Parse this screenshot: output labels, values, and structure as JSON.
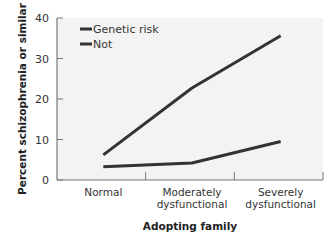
{
  "chart_data": {
    "type": "line",
    "title": "",
    "xlabel": "Adopting family",
    "ylabel": "Percent schizophrenia or similar",
    "categories": [
      "Normal",
      "Moderately dysfunctional",
      "Severely dysfunctional"
    ],
    "category_lines": [
      [
        "Normal"
      ],
      [
        "Moderately",
        "dysfunctional"
      ],
      [
        "Severely",
        "dysfunctional"
      ]
    ],
    "series": [
      {
        "name": "Genetic risk",
        "values": [
          6.2,
          22.7,
          35.6
        ],
        "color": "#333333"
      },
      {
        "name": "Not",
        "values": [
          3.3,
          4.2,
          9.5
        ],
        "color": "#333333"
      }
    ],
    "ylim": [
      0,
      40
    ],
    "yticks": [
      0,
      10,
      20,
      30,
      40
    ],
    "grid": false,
    "legend_position": "upper-left",
    "plot_background": "#f3f3f3"
  }
}
